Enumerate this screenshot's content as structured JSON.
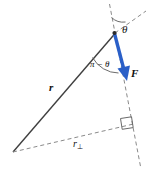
{
  "figure": {
    "kind": "torque-vector-diagram",
    "background_color": "#ffffff",
    "line_color": "#3a3a3a",
    "dashed_color": "#8a8a8a",
    "force_color": "#2a5fc8",
    "text_color": "#111111"
  },
  "labels": {
    "theta": "θ",
    "pi_minus_theta": "π − θ",
    "force": "F",
    "radius": "r",
    "radius_perp_base": "r",
    "radius_perp_sub": "⊥"
  },
  "icons": {
    "right_angle": "right-angle-icon",
    "arrowhead": "arrowhead-icon"
  },
  "geometry": {
    "pivot": [
      13,
      152
    ],
    "apex": [
      115,
      33
    ],
    "force_tip": [
      127,
      80
    ],
    "perp_foot": [
      133,
      124
    ],
    "r_extension_end": [
      146,
      11
    ],
    "force_line_top": [
      109,
      4
    ],
    "force_line_bottom": [
      141,
      169
    ]
  }
}
